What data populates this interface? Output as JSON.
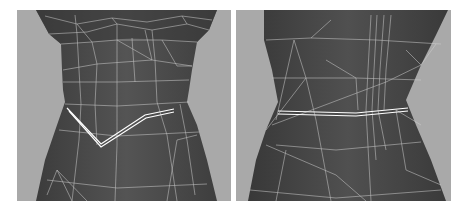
{
  "figure": {
    "panels": [
      {
        "id": "left",
        "subject": "3D wireframe torso mesh, front view",
        "highlight": "V-shaped waistline edge loop"
      },
      {
        "id": "right",
        "subject": "3D wireframe torso mesh, back view",
        "highlight": "straight waistline edge loop"
      }
    ],
    "colors": {
      "background": "#a9a9a9",
      "mesh": "#4a4a4a",
      "mesh_dark": "#3a3a3a",
      "wire": "#d8d8d8",
      "highlight": "#ffffff"
    }
  }
}
